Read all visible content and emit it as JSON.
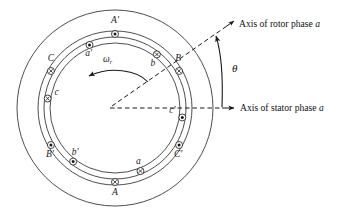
{
  "figure": {
    "center": {
      "x": 115,
      "y": 108
    },
    "rings": [
      {
        "name": "stator-outer-circle",
        "r": 98
      },
      {
        "name": "stator-bore-circle",
        "r": 77
      },
      {
        "name": "rotor-outer-circle",
        "r": 71
      },
      {
        "name": "rotor-inner-circle",
        "r": 65
      }
    ],
    "annotations": {
      "rotor_axis_label": "Axis of rotor phase ",
      "rotor_axis_label_italic": "a",
      "stator_axis_label": "Axis of stator phase ",
      "stator_axis_label_italic": "a",
      "theta_symbol": "θ",
      "omega_symbol": "ω",
      "omega_subscript": "r",
      "rotor_axis_angle_deg": 38,
      "stator_axis_angle_deg": 0
    },
    "stator_conductors": [
      {
        "label": "A'",
        "angle_deg": 90,
        "polarity": "out",
        "label_dx": 0,
        "label_dy": -11
      },
      {
        "label": "B",
        "angle_deg": 30,
        "polarity": "in",
        "label_dx": -1,
        "label_dy": -10
      },
      {
        "label": "C'",
        "angle_deg": -30,
        "polarity": "out",
        "label_dx": -1,
        "label_dy": 12
      },
      {
        "label": "A",
        "angle_deg": -90,
        "polarity": "in",
        "label_dx": 0,
        "label_dy": 13
      },
      {
        "label": "B'",
        "angle_deg": -150,
        "polarity": "out",
        "label_dx": -1,
        "label_dy": 12
      },
      {
        "label": "C",
        "angle_deg": 150,
        "polarity": "in",
        "label_dx": 0,
        "label_dy": -10
      }
    ],
    "rotor_conductors": [
      {
        "label": "a'",
        "angle_deg": 112,
        "polarity": "out",
        "label_dx": -1,
        "label_dy": 11
      },
      {
        "label": "b",
        "angle_deg": 52,
        "polarity": "in",
        "label_dx": -4,
        "label_dy": 12
      },
      {
        "label": "c'",
        "angle_deg": -8,
        "polarity": "out",
        "label_dx": -10,
        "label_dy": -4
      },
      {
        "label": "a",
        "angle_deg": -68,
        "polarity": "in",
        "label_dx": -2,
        "label_dy": -7
      },
      {
        "label": "b'",
        "angle_deg": -128,
        "polarity": "out",
        "label_dx": 2,
        "label_dy": -7
      },
      {
        "label": "c",
        "angle_deg": 172,
        "polarity": "in",
        "label_dx": 9,
        "label_dy": -4
      }
    ],
    "colors": {
      "ink": "#1a1a1a",
      "ring_stroke": "#3a3a3a",
      "background": "#ffffff"
    }
  }
}
